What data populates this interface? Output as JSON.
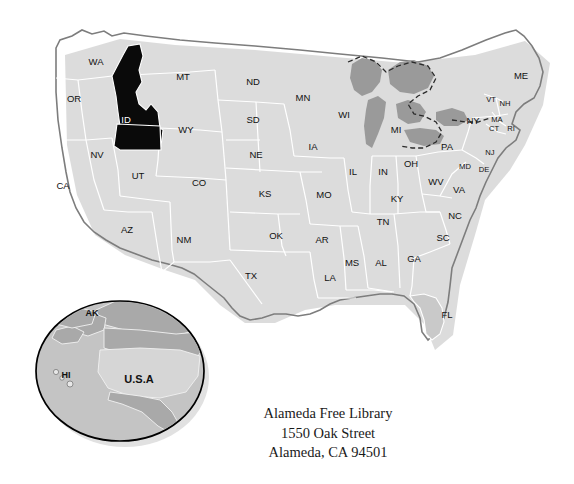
{
  "figure": {
    "name": "usa-map-with-idaho-highlighted",
    "highlighted_state": "ID",
    "colors": {
      "background": "#ffffff",
      "state_fill": "#c9c9c9",
      "state_border": "#ffffff",
      "highlight_fill": "#0a0a0a",
      "highlight_label": "#ffffff",
      "lake_fill": "#9a9a9a",
      "coast_outline": "#7d7d7d",
      "label_text": "#111111",
      "inset_outline": "#000000",
      "inset_ocean": "#c4c4c4",
      "inset_land": "#a9a9a9",
      "inset_usa": "#d6d6d6"
    }
  },
  "map": {
    "states": [
      {
        "code": "WA",
        "x": 96,
        "y": 62
      },
      {
        "code": "OR",
        "x": 74,
        "y": 99
      },
      {
        "code": "CA",
        "x": 63,
        "y": 186
      },
      {
        "code": "NV",
        "x": 97,
        "y": 155
      },
      {
        "code": "ID",
        "x": 126,
        "y": 120,
        "highlighted": true
      },
      {
        "code": "MT",
        "x": 183,
        "y": 77
      },
      {
        "code": "WY",
        "x": 186,
        "y": 130
      },
      {
        "code": "UT",
        "x": 138,
        "y": 176
      },
      {
        "code": "AZ",
        "x": 127,
        "y": 230
      },
      {
        "code": "CO",
        "x": 199,
        "y": 183
      },
      {
        "code": "NM",
        "x": 184,
        "y": 240
      },
      {
        "code": "ND",
        "x": 253,
        "y": 82
      },
      {
        "code": "SD",
        "x": 253,
        "y": 120
      },
      {
        "code": "NE",
        "x": 256,
        "y": 155
      },
      {
        "code": "KS",
        "x": 265,
        "y": 194
      },
      {
        "code": "OK",
        "x": 276,
        "y": 236
      },
      {
        "code": "TX",
        "x": 251,
        "y": 276
      },
      {
        "code": "MN",
        "x": 303,
        "y": 98
      },
      {
        "code": "IA",
        "x": 313,
        "y": 147
      },
      {
        "code": "MO",
        "x": 324,
        "y": 195
      },
      {
        "code": "AR",
        "x": 322,
        "y": 240
      },
      {
        "code": "LA",
        "x": 330,
        "y": 278
      },
      {
        "code": "WI",
        "x": 344,
        "y": 115
      },
      {
        "code": "IL",
        "x": 353,
        "y": 172
      },
      {
        "code": "MS",
        "x": 352,
        "y": 263
      },
      {
        "code": "MI",
        "x": 396,
        "y": 130
      },
      {
        "code": "IN",
        "x": 383,
        "y": 172
      },
      {
        "code": "KY",
        "x": 397,
        "y": 199
      },
      {
        "code": "TN",
        "x": 383,
        "y": 222
      },
      {
        "code": "AL",
        "x": 381,
        "y": 263
      },
      {
        "code": "GA",
        "x": 414,
        "y": 259
      },
      {
        "code": "OH",
        "x": 411,
        "y": 164
      },
      {
        "code": "WV",
        "x": 436,
        "y": 182
      },
      {
        "code": "VA",
        "x": 459,
        "y": 190
      },
      {
        "code": "NC",
        "x": 455,
        "y": 216
      },
      {
        "code": "SC",
        "x": 443,
        "y": 238
      },
      {
        "code": "FL",
        "x": 447,
        "y": 315
      },
      {
        "code": "PA",
        "x": 447,
        "y": 147
      },
      {
        "code": "NY",
        "x": 473,
        "y": 121
      },
      {
        "code": "MD",
        "x": 465,
        "y": 167,
        "small": true
      },
      {
        "code": "DE",
        "x": 484,
        "y": 170,
        "small": true
      },
      {
        "code": "NJ",
        "x": 490,
        "y": 153,
        "small": true
      },
      {
        "code": "CT",
        "x": 494,
        "y": 129,
        "small": true
      },
      {
        "code": "RI",
        "x": 511,
        "y": 129,
        "small": true
      },
      {
        "code": "MA",
        "x": 497,
        "y": 120,
        "small": true
      },
      {
        "code": "VT",
        "x": 491,
        "y": 100,
        "small": true
      },
      {
        "code": "NH",
        "x": 505,
        "y": 104,
        "small": true
      },
      {
        "code": "ME",
        "x": 521,
        "y": 76
      }
    ]
  },
  "inset": {
    "name": "north-america-globe-inset",
    "labels": [
      {
        "text": "AK",
        "x": 92,
        "y": 314
      },
      {
        "text": "HI",
        "x": 66,
        "y": 376
      },
      {
        "text": "U.S.A",
        "x": 139,
        "y": 380
      }
    ]
  },
  "address": {
    "line1": "Alameda Free Library",
    "line2": "1550 Oak Street",
    "line3": "Alameda, CA 94501"
  }
}
